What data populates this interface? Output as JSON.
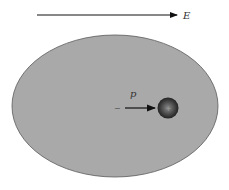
{
  "diagram": {
    "field_label": "E",
    "dipole_label": "p",
    "negative_sign": "−",
    "positive_sign": "+",
    "colors": {
      "background": "#ffffff",
      "ellipse_fill": "#a9a9a9",
      "ellipse_stroke": "#5a5a5a",
      "arrow": "#111111",
      "charge_dark": "#2a2a2a",
      "charge_light": "#7a7a7a"
    }
  }
}
